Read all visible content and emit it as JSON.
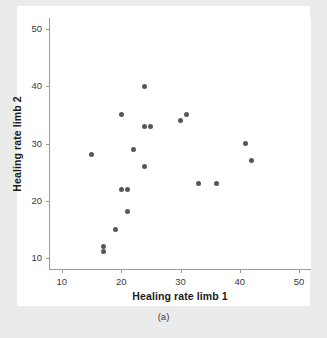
{
  "chart_data": {
    "type": "scatter",
    "title": "",
    "xlabel": "Healing rate limb 1",
    "ylabel": "Healing rate limb 2",
    "caption": "(a)",
    "xlim": [
      8,
      52
    ],
    "ylim": [
      8,
      52
    ],
    "xticks": [
      10,
      20,
      30,
      40,
      50
    ],
    "yticks": [
      10,
      20,
      30,
      40,
      50
    ],
    "xtick_labels": [
      "10",
      "20",
      "30",
      "40",
      "50"
    ],
    "ytick_labels": [
      "10",
      "20",
      "30",
      "40",
      "50"
    ],
    "grid": false,
    "legend": null,
    "marker": {
      "shape": "circle",
      "color": "#575757",
      "size_px": 5
    },
    "points": [
      {
        "x": 15,
        "y": 28
      },
      {
        "x": 17,
        "y": 12
      },
      {
        "x": 17,
        "y": 11
      },
      {
        "x": 19,
        "y": 15
      },
      {
        "x": 20,
        "y": 22
      },
      {
        "x": 20,
        "y": 35
      },
      {
        "x": 21,
        "y": 22
      },
      {
        "x": 21,
        "y": 18
      },
      {
        "x": 22,
        "y": 29
      },
      {
        "x": 24,
        "y": 40
      },
      {
        "x": 24,
        "y": 26
      },
      {
        "x": 24,
        "y": 33
      },
      {
        "x": 25,
        "y": 33
      },
      {
        "x": 30,
        "y": 34
      },
      {
        "x": 31,
        "y": 35
      },
      {
        "x": 33,
        "y": 23
      },
      {
        "x": 36,
        "y": 23
      },
      {
        "x": 41,
        "y": 30
      },
      {
        "x": 42,
        "y": 27
      }
    ]
  },
  "colors": {
    "page_background": "#ebebeb",
    "plot_background": "#ffffff",
    "axis_line": "#9a9a9a",
    "marker": "#575757",
    "text": "#1b1b1b"
  }
}
